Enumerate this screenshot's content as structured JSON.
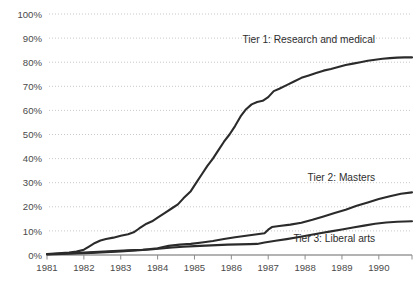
{
  "chart_data": {
    "type": "line",
    "title": "",
    "subtitle": "",
    "xlabel": "",
    "ylabel": "",
    "xlim": [
      1981,
      1990.9
    ],
    "ylim": [
      0,
      100
    ],
    "grid": true,
    "legend_position": "inline-right",
    "y_ticks": [
      "0%",
      "10%",
      "20%",
      "30%",
      "40%",
      "50%",
      "60%",
      "70%",
      "80%",
      "90%",
      "100%"
    ],
    "y_tick_values": [
      0,
      10,
      20,
      30,
      40,
      50,
      60,
      70,
      80,
      90,
      100
    ],
    "x_ticks": [
      "1981",
      "1982",
      "1983",
      "1984",
      "1985",
      "1986",
      "1987",
      "1988",
      "1989",
      "1990"
    ],
    "x_tick_values": [
      1981,
      1982,
      1983,
      1984,
      1985,
      1986,
      1987,
      1988,
      1989,
      1990
    ],
    "line_color": "#2b2b2b",
    "grid_color": "#c9c9c9",
    "axis_color": "#9a9a9a",
    "series": [
      {
        "name": "Tier 1: Research and medical",
        "label": "Tier 1: Research and medical",
        "label_x": 1989.9,
        "label_y": 88,
        "final_value": 82,
        "x": [
          1981.0,
          1981.2,
          1981.4,
          1981.6,
          1981.8,
          1982.0,
          1982.15,
          1982.3,
          1982.45,
          1982.6,
          1982.8,
          1983.0,
          1983.2,
          1983.35,
          1983.5,
          1983.7,
          1983.85,
          1984.0,
          1984.2,
          1984.4,
          1984.55,
          1984.7,
          1984.9,
          1985.05,
          1985.2,
          1985.35,
          1985.5,
          1985.65,
          1985.8,
          1985.95,
          1986.1,
          1986.25,
          1986.4,
          1986.55,
          1986.7,
          1986.85,
          1987.0,
          1987.15,
          1987.3,
          1987.5,
          1987.7,
          1987.9,
          1988.1,
          1988.3,
          1988.5,
          1988.7,
          1988.9,
          1989.1,
          1989.3,
          1989.5,
          1989.7,
          1989.9,
          1990.1,
          1990.3,
          1990.5,
          1990.7,
          1990.9
        ],
        "y": [
          0.4,
          0.6,
          0.8,
          1.0,
          1.4,
          2.2,
          3.6,
          5.0,
          6.0,
          6.6,
          7.2,
          8.0,
          8.6,
          9.4,
          11.0,
          13.0,
          14.0,
          15.5,
          17.5,
          19.5,
          21.0,
          23.5,
          26.5,
          30.0,
          33.5,
          37.0,
          40.0,
          43.5,
          47.0,
          50.0,
          53.5,
          57.5,
          60.5,
          62.5,
          63.5,
          64.0,
          65.5,
          68.0,
          69.0,
          70.5,
          72.0,
          73.5,
          74.5,
          75.5,
          76.5,
          77.2,
          78.0,
          78.8,
          79.4,
          80.0,
          80.6,
          81.0,
          81.4,
          81.7,
          81.9,
          82.0,
          82.0
        ]
      },
      {
        "name": "Tier 2: Masters",
        "label": "Tier 2: Masters",
        "label_x": 1989.9,
        "label_y": 30.5,
        "final_value": 26,
        "x": [
          1981.0,
          1981.3,
          1981.6,
          1982.0,
          1982.4,
          1982.8,
          1983.2,
          1983.6,
          1984.0,
          1984.3,
          1984.6,
          1984.9,
          1985.2,
          1985.5,
          1985.8,
          1986.1,
          1986.4,
          1986.7,
          1986.9,
          1987.0,
          1987.1,
          1987.3,
          1987.6,
          1987.9,
          1988.2,
          1988.5,
          1988.8,
          1989.1,
          1989.4,
          1989.7,
          1990.0,
          1990.3,
          1990.6,
          1990.9
        ],
        "y": [
          0.3,
          0.5,
          0.7,
          1.0,
          1.3,
          1.6,
          1.9,
          2.2,
          2.8,
          3.8,
          4.3,
          4.6,
          5.2,
          5.8,
          6.6,
          7.4,
          8.0,
          8.6,
          9.0,
          10.5,
          11.6,
          12.0,
          12.6,
          13.4,
          14.6,
          16.0,
          17.4,
          18.8,
          20.4,
          21.8,
          23.2,
          24.4,
          25.4,
          26.0
        ]
      },
      {
        "name": "Tier 3: Liberal arts",
        "label": "Tier 3: Liberal arts",
        "label_x": 1989.9,
        "label_y": 5.5,
        "final_value": 14,
        "x": [
          1981.0,
          1981.4,
          1981.8,
          1982.2,
          1982.6,
          1983.0,
          1983.4,
          1983.8,
          1984.1,
          1984.4,
          1984.7,
          1985.0,
          1985.3,
          1985.6,
          1985.9,
          1986.2,
          1986.5,
          1986.7,
          1986.9,
          1987.2,
          1987.5,
          1987.8,
          1988.1,
          1988.4,
          1988.7,
          1989.0,
          1989.3,
          1989.6,
          1989.9,
          1990.2,
          1990.5,
          1990.9
        ],
        "y": [
          0.2,
          0.4,
          0.6,
          0.9,
          1.2,
          1.5,
          1.9,
          2.3,
          2.7,
          3.1,
          3.4,
          3.7,
          3.9,
          4.1,
          4.3,
          4.4,
          4.5,
          4.6,
          5.2,
          5.9,
          6.6,
          7.4,
          8.2,
          9.0,
          9.8,
          10.6,
          11.4,
          12.2,
          13.0,
          13.5,
          13.8,
          14.0
        ]
      }
    ]
  }
}
